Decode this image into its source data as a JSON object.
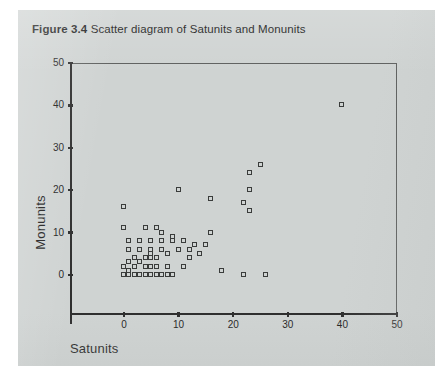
{
  "figure": {
    "label": "Figure 3.4",
    "caption": "Scatter diagram of Satunits and Monunits"
  },
  "colors": {
    "panel_background": "#cfd3d2",
    "page_background": "#ffffff",
    "axis": "#2e2e2e",
    "frame": "#5d5f5e",
    "marker_stroke": "#3a3c3b",
    "text": "#1f1f1f"
  },
  "chart_data": {
    "type": "scatter",
    "title": "Scatter diagram of Satunits and Monunits",
    "xlabel": "Satunits",
    "ylabel": "Monunits",
    "xlim": [
      -4,
      50
    ],
    "ylim": [
      -5,
      50
    ],
    "xticks": [
      0,
      10,
      20,
      30,
      40,
      50
    ],
    "yticks": [
      0,
      10,
      20,
      30,
      40,
      50
    ],
    "xtick_labels": [
      "0",
      "10",
      "20",
      "30",
      "40",
      "50"
    ],
    "ytick_labels": [
      "0",
      "10",
      "20",
      "30",
      "40",
      "50"
    ],
    "grid": false,
    "legend": false,
    "marker": "open-square",
    "series": [
      {
        "name": "observations",
        "points": [
          [
            40,
            40
          ],
          [
            25,
            26
          ],
          [
            23,
            24
          ],
          [
            23,
            20
          ],
          [
            22,
            17
          ],
          [
            23,
            15
          ],
          [
            16,
            10
          ],
          [
            16,
            18
          ],
          [
            10,
            20
          ],
          [
            15,
            7
          ],
          [
            13,
            7
          ],
          [
            12,
            4
          ],
          [
            11,
            2
          ],
          [
            9,
            0
          ],
          [
            22,
            0
          ],
          [
            26,
            0
          ],
          [
            18,
            1
          ],
          [
            7,
            10
          ],
          [
            9,
            9
          ],
          [
            4,
            11
          ],
          [
            6,
            11
          ],
          [
            3,
            8
          ],
          [
            5,
            8
          ],
          [
            7,
            8
          ],
          [
            9,
            8
          ],
          [
            11,
            8
          ],
          [
            1,
            8
          ],
          [
            0,
            16
          ],
          [
            0,
            11
          ],
          [
            1,
            6
          ],
          [
            3,
            6
          ],
          [
            5,
            6
          ],
          [
            7,
            6
          ],
          [
            5,
            5
          ],
          [
            5,
            4
          ],
          [
            1,
            3
          ],
          [
            3,
            3
          ],
          [
            0,
            2
          ],
          [
            2,
            2
          ],
          [
            4,
            2
          ],
          [
            5,
            2
          ],
          [
            1,
            1
          ],
          [
            2,
            0
          ],
          [
            0,
            0
          ],
          [
            1,
            0
          ],
          [
            3,
            0
          ],
          [
            4,
            0
          ],
          [
            5,
            0
          ],
          [
            6,
            0
          ],
          [
            7,
            0
          ],
          [
            8,
            0
          ],
          [
            2,
            4
          ],
          [
            4,
            4
          ],
          [
            6,
            4
          ],
          [
            8,
            5
          ],
          [
            10,
            6
          ],
          [
            12,
            6
          ],
          [
            6,
            2
          ],
          [
            8,
            2
          ],
          [
            14,
            5
          ]
        ]
      }
    ]
  }
}
